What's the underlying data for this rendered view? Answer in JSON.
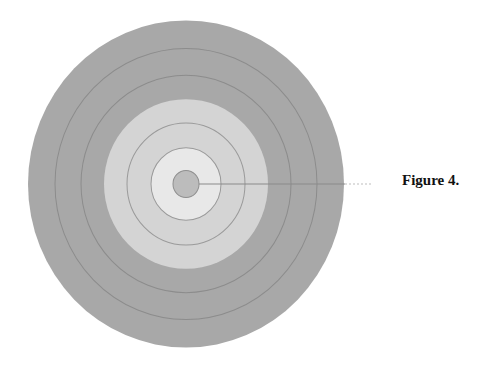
{
  "figure": {
    "caption": "Figure 4.",
    "ring_count": 7,
    "colors": {
      "outer_zone": "#a7a7a7",
      "middle_zone": "#d3d3d3",
      "inner_zone": "#e6e6e6",
      "center_disc": "#bdbdbd",
      "ring_line": "#8a8a8a"
    }
  }
}
